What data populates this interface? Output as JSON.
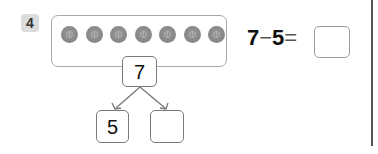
{
  "problem": {
    "number": "4",
    "buttons_count": 8,
    "total": "7",
    "part_known": "5",
    "part_unknown": "",
    "equation": {
      "left": "7",
      "operator": "−",
      "right": "5",
      "equals": "=",
      "answer": ""
    }
  },
  "colors": {
    "number_badge_bg": "#dcdcdc",
    "button_fill": "#8a8a8a",
    "frame_border": "#a9a9a9",
    "box_border": "#7a7a7a"
  }
}
